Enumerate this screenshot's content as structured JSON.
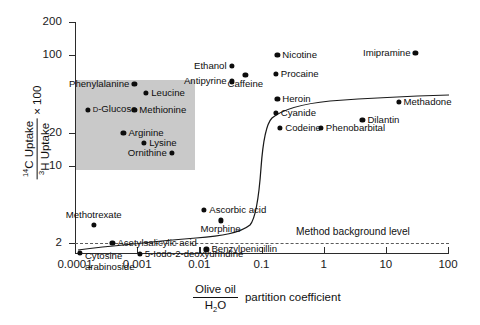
{
  "chart_data": {
    "type": "scatter",
    "title": "",
    "xlabel": "Olive oil / H2O partition coefficient",
    "ylabel": "14C Uptake / 3H Uptake x 100",
    "xscale": "log",
    "yscale": "log",
    "xlim": [
      0.0001,
      100
    ],
    "ylim": [
      1.3,
      200
    ],
    "grid": false,
    "legend": null,
    "xticks": [
      "0.0001",
      "0.001",
      "0.01",
      "0.1",
      "1",
      "10",
      "100"
    ],
    "xtick_values": [
      0.0001,
      0.001,
      0.01,
      0.1,
      1,
      10,
      100
    ],
    "yticks": [
      "200",
      "100",
      "20",
      "10",
      "2"
    ],
    "ytick_values": [
      200,
      100,
      20,
      10,
      2
    ],
    "annotations": [
      {
        "text": "Method background level",
        "y_value": 2,
        "style": "dashed-line"
      }
    ],
    "series": [
      {
        "name": "Brain uptake index",
        "points": [
          {
            "label": "Phenylalanine",
            "x": 0.0009,
            "y": 55,
            "label_pos": "left"
          },
          {
            "label": "Leucine",
            "x": 0.0014,
            "y": 46,
            "label_pos": "right"
          },
          {
            "label": "D-Glucose",
            "x": 0.00016,
            "y": 32,
            "label_pos": "right",
            "smallcap_first": true
          },
          {
            "label": "Methionine",
            "x": 0.0009,
            "y": 32,
            "label_pos": "right"
          },
          {
            "label": "Arginine",
            "x": 0.0006,
            "y": 20,
            "label_pos": "right"
          },
          {
            "label": "Lysine",
            "x": 0.0013,
            "y": 16,
            "label_pos": "right"
          },
          {
            "label": "Ornithine",
            "x": 0.0036,
            "y": 13,
            "label_pos": "left"
          },
          {
            "label": "Ethanol",
            "x": 0.033,
            "y": 80,
            "label_pos": "left"
          },
          {
            "label": "Antipyrine",
            "x": 0.033,
            "y": 58,
            "label_pos": "left"
          },
          {
            "label": "Caffeine",
            "x": 0.055,
            "y": 66,
            "label_pos": "below"
          },
          {
            "label": "Nicotine",
            "x": 0.18,
            "y": 100,
            "label_pos": "right"
          },
          {
            "label": "Procaine",
            "x": 0.17,
            "y": 68,
            "label_pos": "right"
          },
          {
            "label": "Imipramine",
            "x": 30,
            "y": 105,
            "label_pos": "left"
          },
          {
            "label": "Heroin",
            "x": 0.18,
            "y": 40,
            "label_pos": "right"
          },
          {
            "label": "Cyanide",
            "x": 0.17,
            "y": 30,
            "label_pos": "right"
          },
          {
            "label": "Codeine",
            "x": 0.2,
            "y": 22,
            "label_pos": "right"
          },
          {
            "label": "Phenobarbital",
            "x": 0.9,
            "y": 22,
            "label_pos": "right"
          },
          {
            "label": "Dilantin",
            "x": 4.2,
            "y": 26,
            "label_pos": "right"
          },
          {
            "label": "Methadone",
            "x": 16,
            "y": 38,
            "label_pos": "right"
          },
          {
            "label": "Ascorbic acid",
            "x": 0.012,
            "y": 4.0,
            "label_pos": "right"
          },
          {
            "label": "Morphine",
            "x": 0.022,
            "y": 3.2,
            "label_pos": "below"
          },
          {
            "label": "Methotrexate",
            "x": 0.0002,
            "y": 2.9,
            "label_pos": "above"
          },
          {
            "label": "Acetylsalicylic acid",
            "x": 0.0004,
            "y": 2.0,
            "label_pos": "right"
          },
          {
            "label": "Benzylpenicillin",
            "x": 0.013,
            "y": 1.75,
            "label_pos": "right"
          },
          {
            "label": "5-Iodo-2-deoxyurindine",
            "x": 0.0011,
            "y": 1.6,
            "label_pos": "right"
          },
          {
            "label": "Cytosine arabinoside",
            "x": 0.00012,
            "y": 1.62,
            "label_pos": "right",
            "two_line": true
          }
        ]
      }
    ],
    "curve": {
      "name": "sigmoid-fit",
      "description": "Sigmoid relationship between lipid solubility and brain uptake"
    }
  },
  "axis": {
    "y_title_numerator_prefix": "14",
    "y_title_numerator": "C Uptake",
    "y_title_denominator_prefix": "3",
    "y_title_denominator": "H Uptake",
    "y_title_suffix": "× 100",
    "x_title_numerator": "Olive oil",
    "x_title_denominator_prefix": "H",
    "x_title_denominator_sub": "2",
    "x_title_denominator_suffix": "O",
    "x_title_suffix": "partition coefficient"
  },
  "colors": {
    "point": "#0d0d0d",
    "inset_background": "#c9c9c9",
    "axis": "#2b2b2b",
    "dashed_line": "#5b5b5b",
    "page_background": "#ffffff"
  }
}
